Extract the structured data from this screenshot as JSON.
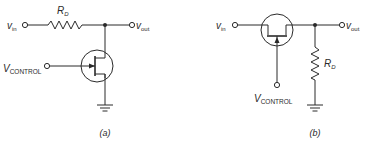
{
  "figure": {
    "circuits": [
      {
        "id": "a",
        "caption": "(a)",
        "input_label": "v",
        "input_sub": "in",
        "output_label": "v",
        "output_sub": "out",
        "resistor_label": "R",
        "resistor_sub": "D",
        "control_label": "V",
        "control_sub": "CONTROL",
        "transistor": "JFET",
        "resistor_position": "series",
        "transistor_position": "shunt"
      },
      {
        "id": "b",
        "caption": "(b)",
        "input_label": "v",
        "input_sub": "in",
        "output_label": "v",
        "output_sub": "out",
        "resistor_label": "R",
        "resistor_sub": "D",
        "control_label": "V",
        "control_sub": "CONTROL",
        "transistor": "FET",
        "resistor_position": "shunt",
        "transistor_position": "series"
      }
    ],
    "colors": {
      "line": "#2a2a2a",
      "background": "#ffffff"
    }
  }
}
